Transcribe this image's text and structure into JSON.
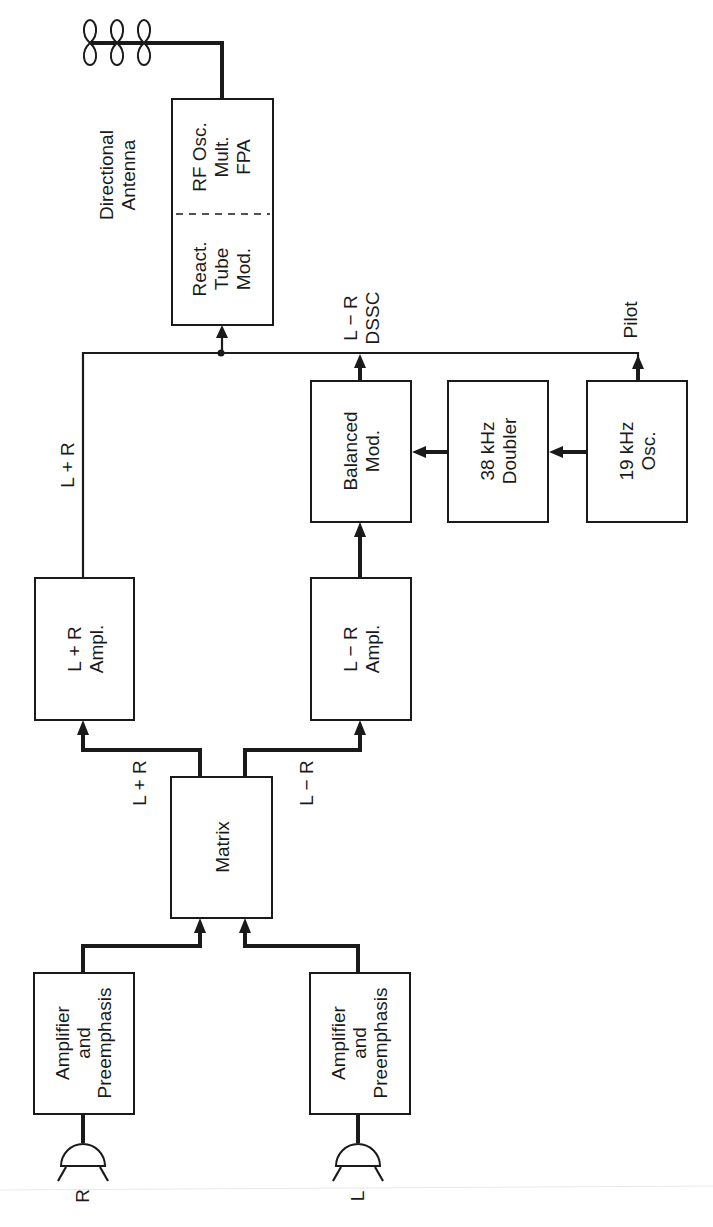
{
  "diagram": {
    "orientation": "rotated 90° counter-clockwise",
    "colors": {
      "ink": "#1a1a1a",
      "background": "#ffffff"
    },
    "antenna": {
      "icon": "directional-antenna-icon",
      "label_line1": "Directional",
      "label_line2": "Antenna"
    },
    "blocks": {
      "rf": {
        "upper_line1": "RF Osc.",
        "upper_line2": "Mult.",
        "upper_line3": "FPA",
        "lower_line1": "React.",
        "lower_line2": "Tube",
        "lower_line3": "Mod."
      },
      "balanced_mod": {
        "line1": "Balanced",
        "line2": "Mod."
      },
      "doubler": {
        "line1": "38 kHz",
        "line2": "Doubler"
      },
      "osc19": {
        "line1": "19 kHz",
        "line2": "Osc."
      },
      "lpr_ampl": {
        "line1": "L + R",
        "line2": "Ampl."
      },
      "lmr_ampl": {
        "line1": "L − R",
        "line2": "Ampl."
      },
      "matrix": {
        "line1": "Matrix"
      },
      "amp_r": {
        "line1": "Amplifier",
        "line2": "and",
        "line3": "Preemphasis"
      },
      "amp_l": {
        "line1": "Amplifier",
        "line2": "and",
        "line3": "Preemphasis"
      }
    },
    "signals": {
      "lpr_bus": "L + R",
      "lmr_dssc_line1": "L − R",
      "lmr_dssc_line2": "DSSC",
      "pilot": "Pilot",
      "matrix_out_sum": "L + R",
      "matrix_out_diff": "L − R"
    },
    "inputs": {
      "right_mic_label": "R",
      "left_mic_label": "L",
      "mic_icon": "microphone-icon"
    }
  }
}
